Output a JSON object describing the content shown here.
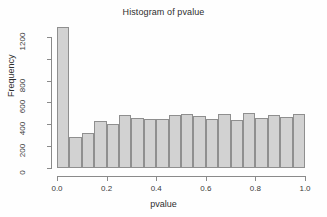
{
  "chart_data": {
    "type": "bar",
    "title": "Histogram of pvalue",
    "subtitle": "",
    "xlabel": "pvalue",
    "ylabel": "Frequency",
    "xlim": [
      0.0,
      1.0
    ],
    "ylim": [
      0,
      1300
    ],
    "grid": false,
    "legend": null,
    "bin_width": 0.05,
    "bin_edges": [
      0.0,
      0.05,
      0.1,
      0.15,
      0.2,
      0.25,
      0.3,
      0.35,
      0.4,
      0.45,
      0.5,
      0.55,
      0.6,
      0.65,
      0.7,
      0.75,
      0.8,
      0.85,
      0.9,
      0.95,
      1.0
    ],
    "categories": [
      "0.00-0.05",
      "0.05-0.10",
      "0.10-0.15",
      "0.15-0.20",
      "0.20-0.25",
      "0.25-0.30",
      "0.30-0.35",
      "0.35-0.40",
      "0.40-0.45",
      "0.45-0.50",
      "0.50-0.55",
      "0.55-0.60",
      "0.60-0.65",
      "0.65-0.70",
      "0.70-0.75",
      "0.75-0.80",
      "0.80-0.85",
      "0.85-0.90",
      "0.90-0.95",
      "0.95-1.00"
    ],
    "values": [
      1290,
      285,
      325,
      430,
      405,
      485,
      458,
      450,
      448,
      483,
      490,
      475,
      447,
      492,
      437,
      503,
      462,
      483,
      465,
      492
    ],
    "xticks": [
      0.0,
      0.2,
      0.4,
      0.6,
      0.8,
      1.0
    ],
    "xticklabels": [
      "0.0",
      "0.2",
      "0.4",
      "0.6",
      "0.8",
      "1.0"
    ],
    "yticks": [
      0,
      200,
      400,
      600,
      800,
      1000,
      1200
    ],
    "yticklabels": [
      "0",
      "200",
      "400",
      "600",
      "800",
      "",
      "1200"
    ],
    "bar_fill_color": "#d2d2d2",
    "bar_border_color": "#8f8f8f",
    "axis_color": "#8a8a8a",
    "background_color": "#ffffff"
  }
}
